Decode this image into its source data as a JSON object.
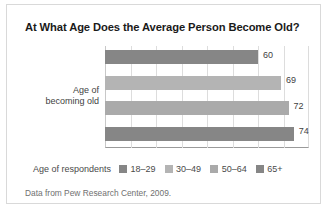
{
  "figure": {
    "title": "At What Age Does the Average Person Become Old?",
    "source_note": "Data from Pew Research Center, 2009.",
    "y_axis_label_line1": "Age of",
    "y_axis_label_line2": "becoming old",
    "legend_title": "Age of respondents",
    "frame_color": "#d9d9d9",
    "grid_color": "#dddddd",
    "axis_color": "#9a9a9a"
  },
  "chart_data": {
    "type": "bar",
    "orientation": "horizontal",
    "title": "At What Age Does the Average Person Become Old?",
    "xlabel": "",
    "ylabel": "Age of becoming old",
    "categories": [
      "18–29",
      "30–49",
      "50–64",
      "65+"
    ],
    "values": [
      60,
      69,
      72,
      74
    ],
    "value_labels": [
      "60",
      "69",
      "72",
      "74"
    ],
    "colors": [
      "#868686",
      "#b4b4b4",
      "#aaaaaa",
      "#868686"
    ],
    "xlim": [
      0,
      80
    ],
    "grid": true,
    "gridline_values": [
      10,
      20,
      30,
      40,
      50,
      60,
      70
    ],
    "tick_labels_visible": false,
    "legend": {
      "position": "bottom",
      "title": "Age of respondents",
      "entries": [
        {
          "label": "18–29",
          "color": "#868686"
        },
        {
          "label": "30–49",
          "color": "#b4b4b4"
        },
        {
          "label": "50–64",
          "color": "#aaaaaa"
        },
        {
          "label": "65+",
          "color": "#868686"
        }
      ]
    }
  }
}
